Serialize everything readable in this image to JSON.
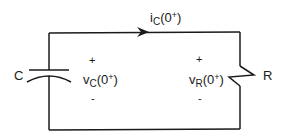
{
  "diagram": {
    "type": "RC circuit",
    "colors": {
      "wire": "#1a1a1a",
      "background": "#ffffff"
    },
    "current": {
      "symbol": "i",
      "subscript": "C",
      "argument": "(0",
      "superscript": "+",
      "close": ")"
    },
    "capacitor": {
      "label": "C",
      "voltage": {
        "symbol": "v",
        "subscript": "C",
        "argument": "(0",
        "superscript": "+",
        "close": ")"
      },
      "plus": "+",
      "minus": "-"
    },
    "resistor": {
      "label": "R",
      "voltage": {
        "symbol": "v",
        "subscript": "R",
        "argument": "(0",
        "superscript": "+",
        "close": ")"
      },
      "plus": "+",
      "minus": "-"
    }
  }
}
